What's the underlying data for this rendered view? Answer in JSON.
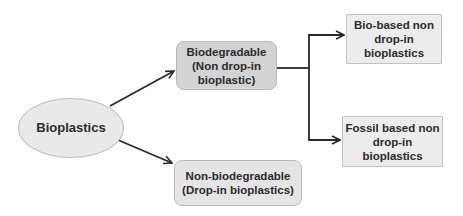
{
  "diagram": {
    "type": "tree",
    "nodes": {
      "root": {
        "label": "Bioplastics",
        "shape": "ellipse"
      },
      "biodegradable": {
        "label": "Biodegradable\n(Non drop-in\nbioplastic)",
        "shape": "rounded-rect"
      },
      "non_biodegradable": {
        "label": "Non-biodegradable\n(Drop-in bioplastics)",
        "shape": "rounded-rect"
      },
      "bio_based": {
        "label": "Bio-based non\ndrop-in\nbioplastics",
        "shape": "rect"
      },
      "fossil_based": {
        "label": "Fossil based non\ndrop-in\nbioplastics",
        "shape": "rect"
      }
    },
    "edges": [
      {
        "from": "root",
        "to": "biodegradable"
      },
      {
        "from": "root",
        "to": "non_biodegradable"
      },
      {
        "from": "biodegradable",
        "to": "bio_based"
      },
      {
        "from": "biodegradable",
        "to": "fossil_based"
      }
    ],
    "colors": {
      "arrow": "#2a2a2a",
      "ellipse_fill": "#e9e9e9",
      "biodegradable_fill": "#d3d3d3",
      "non_biodegradable_fill": "#e4e4e4",
      "leaf_fill": "#ececec",
      "text": "#2b2b2b"
    }
  }
}
